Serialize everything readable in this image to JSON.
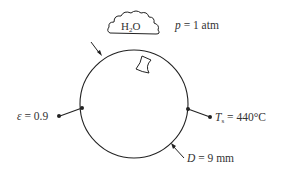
{
  "diagram": {
    "type": "heat-transfer-schematic",
    "object": "sphere",
    "environment": {
      "fluid": "H2O",
      "fluid_label_main": "H",
      "fluid_label_sub": "2",
      "fluid_label_end": "O",
      "pressure_symbol": "p",
      "pressure_value": "= 1 atm"
    },
    "surface": {
      "emissivity_symbol": "ε",
      "emissivity_value": "= 0.9",
      "temperature_symbol": "T",
      "temperature_sub": "s",
      "temperature_value": "= 440°C",
      "diameter_symbol": "D",
      "diameter_value": "= 9 mm"
    },
    "colors": {
      "line": "#222222",
      "background": "#ffffff"
    }
  }
}
